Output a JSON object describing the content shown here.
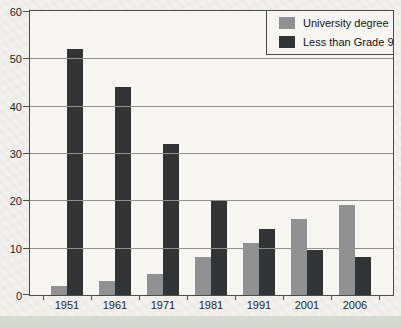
{
  "chart_data": {
    "type": "bar",
    "title": "",
    "xlabel": "",
    "ylabel": "",
    "categories": [
      "1951",
      "1961",
      "1971",
      "1981",
      "1991",
      "2001",
      "2006"
    ],
    "series": [
      {
        "name": "University degree",
        "color": "#8f9193",
        "values": [
          2,
          3,
          4.5,
          8,
          11,
          16,
          19
        ]
      },
      {
        "name": "Less than Grade 9",
        "color": "#313335",
        "values": [
          52,
          44,
          32,
          20,
          14,
          9.5,
          8
        ]
      }
    ],
    "ylim": [
      0,
      60
    ],
    "yticks": [
      0,
      10,
      20,
      30,
      40,
      50,
      60
    ],
    "grid": "horizontal",
    "legend_position": "top-right"
  },
  "colors": {
    "page_background": "#f3f2ee",
    "plot_background": "#f7f6f2",
    "axis_frame": "#4b4b4b",
    "gridline": "#919191",
    "text": "#1e1e1e",
    "bottom_strip": "#d6d8d2"
  }
}
